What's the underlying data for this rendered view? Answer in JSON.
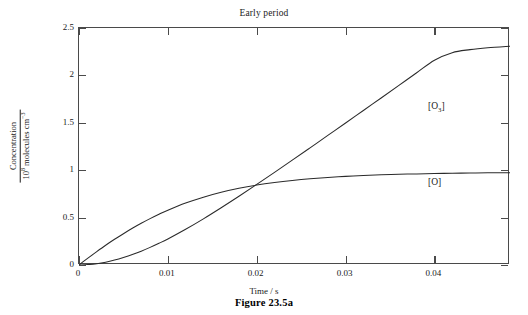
{
  "figure": {
    "caption": "Figure 23.5a"
  },
  "chart_data": {
    "type": "line",
    "title": "Early period",
    "xlabel": "Time / s",
    "ylabel_numerator": "Concentration",
    "ylabel_denominator_prefix": "10",
    "ylabel_denominator_exp": "8",
    "ylabel_denominator_suffix": " molecules cm",
    "ylabel_denominator_suffix_exp": "−3",
    "ylabel_plain": "Concentration / 10^8 molecules cm^-3",
    "xlim": [
      0,
      0.0485
    ],
    "ylim": [
      0,
      2.5
    ],
    "grid": false,
    "legend_position": "inline-annotations",
    "xticks": [
      0,
      0.01,
      0.02,
      0.03,
      0.04
    ],
    "xtick_labels": [
      "0",
      "0.01",
      "0.02",
      "0.03",
      "0.04"
    ],
    "yticks": [
      0,
      0.5,
      1,
      1.5,
      2,
      2.5
    ],
    "ytick_labels": [
      "0",
      "0.5",
      "1",
      "1.5",
      "2",
      "2.5"
    ],
    "axis_color": "#4a4a4a",
    "curve_color": "#2a2a2a",
    "annotations": [
      {
        "label_prefix": "[O",
        "label_sub": "3",
        "label_suffix": "]",
        "label_plain": "[O3]",
        "x": 0.0395,
        "y": 1.6
      },
      {
        "label_prefix": "[O",
        "label_sub": "",
        "label_suffix": "]",
        "label_plain": "[O]",
        "x": 0.0395,
        "y": 0.8
      }
    ],
    "intersection": {
      "x": 0.0245,
      "y": 0.83
    },
    "series": [
      {
        "name": "[O]",
        "x": [
          0,
          0.001,
          0.002,
          0.003,
          0.004,
          0.005,
          0.006,
          0.007,
          0.008,
          0.009,
          0.01,
          0.012,
          0.014,
          0.016,
          0.018,
          0.02,
          0.022,
          0.024,
          0.026,
          0.028,
          0.03,
          0.032,
          0.034,
          0.036,
          0.038,
          0.04,
          0.042,
          0.044,
          0.046,
          0.0485
        ],
        "values": [
          0,
          0.072,
          0.141,
          0.208,
          0.271,
          0.33,
          0.387,
          0.44,
          0.489,
          0.535,
          0.578,
          0.653,
          0.715,
          0.767,
          0.809,
          0.843,
          0.87,
          0.892,
          0.91,
          0.924,
          0.935,
          0.944,
          0.951,
          0.957,
          0.961,
          0.965,
          0.968,
          0.97,
          0.972,
          0.974
        ]
      },
      {
        "name": "[O3]",
        "x": [
          0,
          0.001,
          0.002,
          0.003,
          0.004,
          0.005,
          0.006,
          0.007,
          0.008,
          0.009,
          0.01,
          0.012,
          0.014,
          0.016,
          0.018,
          0.02,
          0.022,
          0.024,
          0.026,
          0.028,
          0.03,
          0.032,
          0.034,
          0.036,
          0.038,
          0.04,
          0.042,
          0.044,
          0.046,
          0.0485
        ],
        "values": [
          0,
          0.004,
          0.014,
          0.03,
          0.052,
          0.079,
          0.11,
          0.146,
          0.186,
          0.229,
          0.275,
          0.377,
          0.487,
          0.604,
          0.725,
          0.85,
          0.977,
          1.106,
          1.236,
          1.367,
          1.498,
          1.63,
          1.762,
          1.895,
          2.028,
          2.16,
          2.24,
          2.272,
          2.292,
          2.308
        ]
      }
    ]
  }
}
